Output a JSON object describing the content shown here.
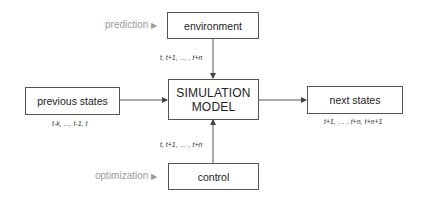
{
  "diagram": {
    "center": {
      "line1": "SIMULATION",
      "line2": "MODEL"
    },
    "environment": {
      "label": "environment",
      "side_label": "prediction",
      "side_marker": "▶",
      "edge_label": "t, t+1, … , t+n"
    },
    "control": {
      "label": "control",
      "side_label": "optimization",
      "side_marker": "▶",
      "edge_label": "t, t+1, … , t+n"
    },
    "previous_states": {
      "label": "previous states",
      "sub_label": "t-k, ..., t-1, t"
    },
    "next_states": {
      "label": "next states",
      "sub_label": "t+1, … , t+n, t+n+1"
    },
    "colors": {
      "box_border": "#555555",
      "arrow": "#444444",
      "side_text": "#9a9a9a",
      "background": "#ffffff"
    }
  }
}
